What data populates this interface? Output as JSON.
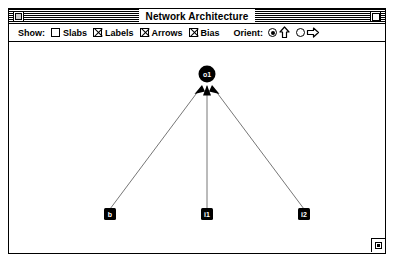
{
  "window": {
    "title": "Network Architecture",
    "close_box": "close-box",
    "zoom_box": "zoom-box",
    "grow_box": "grow-box"
  },
  "toolbar": {
    "show_label": "Show:",
    "checkboxes": [
      {
        "label": "Slabs",
        "checked": false
      },
      {
        "label": "Labels",
        "checked": true
      },
      {
        "label": "Arrows",
        "checked": true
      },
      {
        "label": "Bias",
        "checked": true
      }
    ],
    "orient_label": "Orient:",
    "orient_options": [
      {
        "icon": "arrow-up-icon",
        "selected": true
      },
      {
        "icon": "arrow-right-icon",
        "selected": false
      }
    ]
  },
  "diagram": {
    "nodes": [
      {
        "id": "o1",
        "label": "o1",
        "shape": "circle",
        "x": 198,
        "y": 32,
        "r": 8
      },
      {
        "id": "b",
        "label": "b",
        "shape": "square",
        "x": 101,
        "y": 172,
        "size": 11
      },
      {
        "id": "i1",
        "label": "i1",
        "shape": "square",
        "x": 198,
        "y": 172,
        "size": 11
      },
      {
        "id": "i2",
        "label": "i2",
        "shape": "square",
        "x": 295,
        "y": 172,
        "size": 11
      }
    ],
    "connections": [
      {
        "from": "b",
        "to": "o1",
        "arrow": true
      },
      {
        "from": "i1",
        "to": "o1",
        "arrow": true
      },
      {
        "from": "i2",
        "to": "o1",
        "arrow": true
      }
    ],
    "colors": {
      "node_fill": "#000000",
      "node_label": "#ffffff",
      "edge": "#555555",
      "background": "#ffffff"
    }
  }
}
